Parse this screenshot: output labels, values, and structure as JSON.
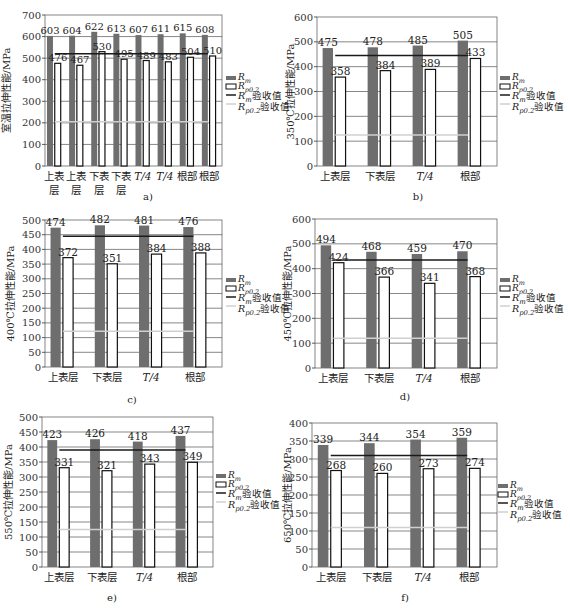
{
  "legend": {
    "rm": "R",
    "rm_sub": "m",
    "rp": "R",
    "rp_sub": "p0.2",
    "rm_accept": "R",
    "rm_accept_sub": "m",
    "rm_accept_suffix": "验收值",
    "rp_accept": "R",
    "rp_accept_sub": "p0.2",
    "rp_accept_suffix": "验收值"
  },
  "colors": {
    "rm_bar": "#6e6e6e",
    "rp_bar": "#ffffff",
    "rm_accept_line": "#1a1a1a",
    "rp_accept_line": "#d0d0d0",
    "grid": "#555555"
  },
  "chart_data": [
    {
      "id": "a",
      "type": "bar",
      "caption": "a)",
      "ylabel": "室温拉伸性能/MPa",
      "ylim": [
        0,
        700
      ],
      "yticks": [
        0,
        100,
        200,
        300,
        400,
        500,
        600,
        700
      ],
      "categories": [
        [
          "上表",
          "层"
        ],
        [
          "上表",
          "层"
        ],
        [
          "下表",
          "层"
        ],
        [
          "下表",
          "层"
        ],
        [
          "T/4"
        ],
        [
          "T/4"
        ],
        [
          "根部"
        ],
        [
          "根部"
        ]
      ],
      "series": [
        {
          "name": "Rm",
          "values": [
            603,
            604,
            622,
            613,
            607,
            611,
            615,
            608
          ]
        },
        {
          "name": "Rp0.2",
          "values": [
            476,
            467,
            530,
            495,
            489,
            483,
            504,
            510
          ]
        }
      ],
      "rm_accept": 520,
      "rp_accept": 205,
      "grid": true,
      "legend_position": "right"
    },
    {
      "id": "b",
      "type": "bar",
      "caption": "b)",
      "ylabel": "350℃拉伸性能/MPa",
      "ylim": [
        0,
        600
      ],
      "yticks": [
        0,
        100,
        200,
        300,
        400,
        500,
        600
      ],
      "categories": [
        [
          "上表层"
        ],
        [
          "下表层"
        ],
        [
          "T/4"
        ],
        [
          "根部"
        ]
      ],
      "series": [
        {
          "name": "Rm",
          "values": [
            475,
            478,
            485,
            505
          ]
        },
        {
          "name": "Rp0.2",
          "values": [
            358,
            384,
            389,
            433
          ]
        }
      ],
      "rm_accept": 445,
      "rp_accept": 125,
      "grid": true,
      "legend_position": "right"
    },
    {
      "id": "c",
      "type": "bar",
      "caption": "c)",
      "ylabel": "400℃拉伸性能/MPa",
      "ylim": [
        0,
        500
      ],
      "yticks": [
        0,
        50,
        100,
        150,
        200,
        250,
        300,
        350,
        400,
        450,
        500
      ],
      "categories": [
        [
          "上表层"
        ],
        [
          "下表层"
        ],
        [
          "T/4"
        ],
        [
          "根部"
        ]
      ],
      "series": [
        {
          "name": "Rm",
          "values": [
            474,
            482,
            481,
            476
          ]
        },
        {
          "name": "Rp0.2",
          "values": [
            372,
            351,
            384,
            388
          ]
        }
      ],
      "rm_accept": 445,
      "rp_accept": 122,
      "grid": true,
      "legend_position": "right"
    },
    {
      "id": "d",
      "type": "bar",
      "caption": "d)",
      "ylabel": "450℃拉伸性能/MPa",
      "ylim": [
        0,
        600
      ],
      "yticks": [
        0,
        100,
        200,
        300,
        400,
        500,
        600
      ],
      "categories": [
        [
          "上表层"
        ],
        [
          "下表层"
        ],
        [
          "T/4"
        ],
        [
          "根部"
        ]
      ],
      "series": [
        {
          "name": "Rm",
          "values": [
            494,
            468,
            459,
            470
          ]
        },
        {
          "name": "Rp0.2",
          "values": [
            424,
            366,
            341,
            368
          ]
        }
      ],
      "rm_accept": 435,
      "rp_accept": 120,
      "grid": true,
      "legend_position": "right"
    },
    {
      "id": "e",
      "type": "bar",
      "caption": "e)",
      "ylabel": "550℃拉伸性能/MPa",
      "ylim": [
        0,
        500
      ],
      "yticks": [
        0,
        50,
        100,
        150,
        200,
        250,
        300,
        350,
        400,
        450,
        500
      ],
      "categories": [
        [
          "上表层"
        ],
        [
          "下表层"
        ],
        [
          "T/4"
        ],
        [
          "根部"
        ]
      ],
      "series": [
        {
          "name": "Rm",
          "values": [
            423,
            426,
            418,
            437
          ]
        },
        {
          "name": "Rp0.2",
          "values": [
            331,
            321,
            343,
            349
          ]
        }
      ],
      "rm_accept": 390,
      "rp_accept": 125,
      "grid": true,
      "legend_position": "right"
    },
    {
      "id": "f",
      "type": "bar",
      "caption": "f)",
      "ylabel": "650℃拉伸性能/MPa",
      "ylim": [
        0,
        400
      ],
      "yticks": [
        0,
        50,
        100,
        150,
        200,
        250,
        300,
        350,
        400
      ],
      "categories": [
        [
          "上表层"
        ],
        [
          "下表层"
        ],
        [
          "T/4"
        ],
        [
          "根部"
        ]
      ],
      "series": [
        {
          "name": "Rm",
          "values": [
            339,
            344,
            354,
            359
          ]
        },
        {
          "name": "Rp0.2",
          "values": [
            268,
            260,
            273,
            274
          ]
        }
      ],
      "rm_accept": 310,
      "rp_accept": 110,
      "grid": true,
      "legend_position": "right"
    }
  ],
  "layout": [
    {
      "id": "a",
      "x0": 45,
      "x1": 222,
      "yTop": 15,
      "yBot": 166,
      "legendX": 226,
      "legendY": 80,
      "captionX": 148,
      "captionY": 200,
      "ylabelX": 10,
      "tickFont": 10
    },
    {
      "id": "b",
      "x0": 317,
      "x1": 497,
      "yTop": 17,
      "yBot": 166,
      "legendX": 500,
      "legendY": 80,
      "captionX": 418,
      "captionY": 200,
      "ylabelX": 294,
      "tickFont": 10
    },
    {
      "id": "c",
      "x0": 45,
      "x1": 222,
      "yTop": 220,
      "yBot": 367,
      "legendX": 226,
      "legendY": 282,
      "captionX": 132,
      "captionY": 403,
      "ylabelX": 14,
      "tickFont": 10
    },
    {
      "id": "d",
      "x0": 315,
      "x1": 497,
      "yTop": 219,
      "yBot": 368,
      "legendX": 500,
      "legendY": 282,
      "captionX": 405,
      "captionY": 400,
      "ylabelX": 291,
      "tickFont": 10
    },
    {
      "id": "e",
      "x0": 42,
      "x1": 213,
      "yTop": 417,
      "yBot": 567,
      "legendX": 216,
      "legendY": 478,
      "captionX": 112,
      "captionY": 601,
      "ylabelX": 12,
      "tickFont": 10
    },
    {
      "id": "f",
      "x0": 312,
      "x1": 497,
      "yTop": 423,
      "yBot": 567,
      "legendX": 498,
      "legendY": 488,
      "captionX": 405,
      "captionY": 601,
      "ylabelX": 291,
      "tickFont": 10
    }
  ]
}
